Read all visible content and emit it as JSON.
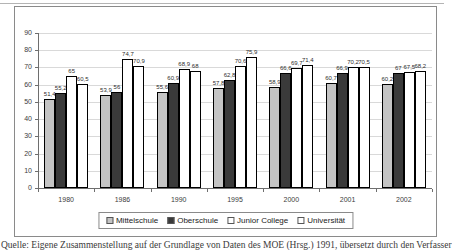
{
  "caption": {
    "text": "Quelle: Eigene Zusammenstellung auf der Grundlage von Daten des MOE (Hrsg.) 1991, übersetzt durch den Verfasser"
  },
  "chart_data": {
    "type": "bar",
    "title": "",
    "xlabel": "",
    "ylabel": "",
    "categories": [
      "1980",
      "1986",
      "1990",
      "1995",
      "2000",
      "2001",
      "2002"
    ],
    "series": [
      {
        "name": "Mittelschule",
        "color": "#c4c4c4",
        "values": [
          51.4,
          53.9,
          55.6,
          57.8,
          58.9,
          60.7,
          60.2
        ],
        "labels": [
          "51,4",
          "53,9",
          "55,6",
          "57,8",
          "58,9",
          "60,7",
          "60,2"
        ]
      },
      {
        "name": "Oberschule",
        "color": "#3a3a3a",
        "values": [
          55.2,
          56,
          60.9,
          62.8,
          66.6,
          66.9,
          67
        ],
        "labels": [
          "55,2",
          "56",
          "60,9",
          "62,8",
          "66,6",
          "66,9",
          "67"
        ]
      },
      {
        "name": "Junior College",
        "color": "#ffffff",
        "values": [
          65,
          74.7,
          68.9,
          70.6,
          69.7,
          70.2,
          67.5
        ],
        "labels": [
          "65",
          "74,7",
          "68,9",
          "70,6",
          "69,7",
          "70,2",
          "67,5"
        ]
      },
      {
        "name": "Universität",
        "color": "#ffffff",
        "values": [
          60.5,
          70.9,
          68,
          75.9,
          71.4,
          70.5,
          68.2
        ],
        "labels": [
          "60,5",
          "70,9",
          "68",
          "75,9",
          "71,4",
          "70,5",
          "68,2"
        ]
      }
    ],
    "ylim": [
      0,
      90
    ],
    "ytick_step": 10,
    "grid": true,
    "legend_position": "bottom"
  }
}
